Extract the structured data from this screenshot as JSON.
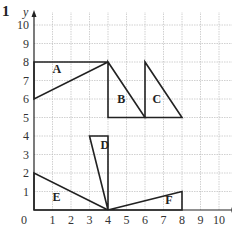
{
  "question_number": "1",
  "axes": {
    "x_label": "x",
    "y_label": "y",
    "x_ticks": [
      "0",
      "1",
      "2",
      "3",
      "4",
      "5",
      "6",
      "7",
      "8",
      "9",
      "10"
    ],
    "y_ticks": [
      "1",
      "2",
      "3",
      "4",
      "5",
      "6",
      "7",
      "8",
      "9",
      "10"
    ],
    "x_range": [
      0,
      11
    ],
    "y_range": [
      0,
      10.7
    ],
    "grid": true
  },
  "shapes": [
    {
      "label": "A",
      "vertices": [
        [
          0,
          6
        ],
        [
          0,
          8
        ],
        [
          4,
          8
        ]
      ],
      "label_pos": [
        1,
        7.4
      ]
    },
    {
      "label": "B",
      "vertices": [
        [
          4,
          8
        ],
        [
          4,
          5
        ],
        [
          6,
          5
        ]
      ],
      "label_pos": [
        4.5,
        5.8
      ]
    },
    {
      "label": "C",
      "vertices": [
        [
          6,
          8
        ],
        [
          6,
          5
        ],
        [
          8,
          5
        ]
      ],
      "label_pos": [
        6.4,
        5.8
      ]
    },
    {
      "label": "D",
      "vertices": [
        [
          3,
          4
        ],
        [
          4,
          4
        ],
        [
          4,
          0
        ]
      ],
      "label_pos": [
        3.6,
        3.3
      ]
    },
    {
      "label": "E",
      "vertices": [
        [
          0,
          2
        ],
        [
          0,
          0
        ],
        [
          4,
          0
        ]
      ],
      "label_pos": [
        1,
        0.5
      ]
    },
    {
      "label": "F",
      "vertices": [
        [
          4,
          0
        ],
        [
          8,
          0
        ],
        [
          8,
          1
        ]
      ],
      "label_pos": [
        7.1,
        0.3
      ]
    }
  ],
  "colors": {
    "grid": "#bdbdbd",
    "lines": "#222222"
  }
}
